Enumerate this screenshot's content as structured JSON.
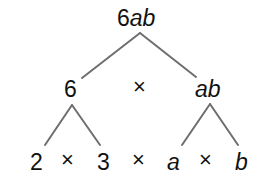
{
  "tree": {
    "root": {
      "number": "6",
      "variables": "ab"
    },
    "level1": {
      "left": "6",
      "operator": "×",
      "right": "ab"
    },
    "level2": {
      "items": [
        "2",
        "×",
        "3",
        "×",
        "a",
        "×",
        "b"
      ]
    }
  },
  "colors": {
    "line": "#6e6e6e",
    "text": "#111111"
  }
}
